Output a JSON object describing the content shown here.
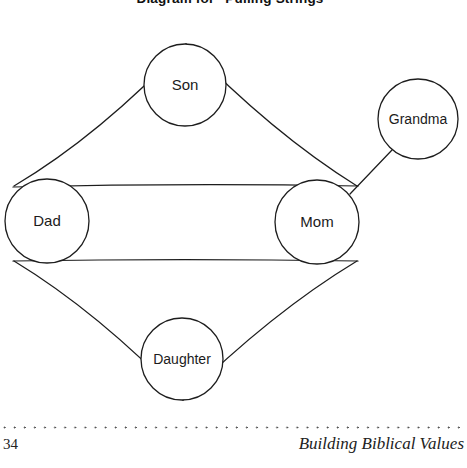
{
  "page": {
    "title": "Diagram for “Pulling Strings”",
    "background_color": "#ffffff",
    "ink_color": "#1d1d1d"
  },
  "diagram": {
    "type": "relationship-diagram",
    "nodes": [
      {
        "id": "son",
        "label": "Son",
        "cx": 185,
        "cy": 85,
        "r": 41
      },
      {
        "id": "grandma",
        "label": "Grandma",
        "cx": 418,
        "cy": 119,
        "r": 40
      },
      {
        "id": "dad",
        "label": "Dad",
        "cx": 47,
        "cy": 221,
        "r": 42
      },
      {
        "id": "mom",
        "label": "Mom",
        "cx": 317,
        "cy": 222,
        "r": 42
      },
      {
        "id": "daughter",
        "label": "Daughter",
        "cx": 182,
        "cy": 359,
        "r": 41
      }
    ],
    "edges": [
      {
        "from": "dad",
        "to": "son",
        "style": "straight"
      },
      {
        "from": "son",
        "to": "mom",
        "style": "straight"
      },
      {
        "from": "dad",
        "to": "mom",
        "style": "straight-upper"
      },
      {
        "from": "dad",
        "to": "mom",
        "style": "straight-lower"
      },
      {
        "from": "dad",
        "to": "daughter",
        "style": "straight"
      },
      {
        "from": "daughter",
        "to": "mom",
        "style": "straight"
      },
      {
        "from": "grandma",
        "to": "mom",
        "style": "straight"
      }
    ]
  },
  "footer": {
    "page_number": "34",
    "book_title": "Building Biblical Values",
    "rule_style": "dotted"
  }
}
